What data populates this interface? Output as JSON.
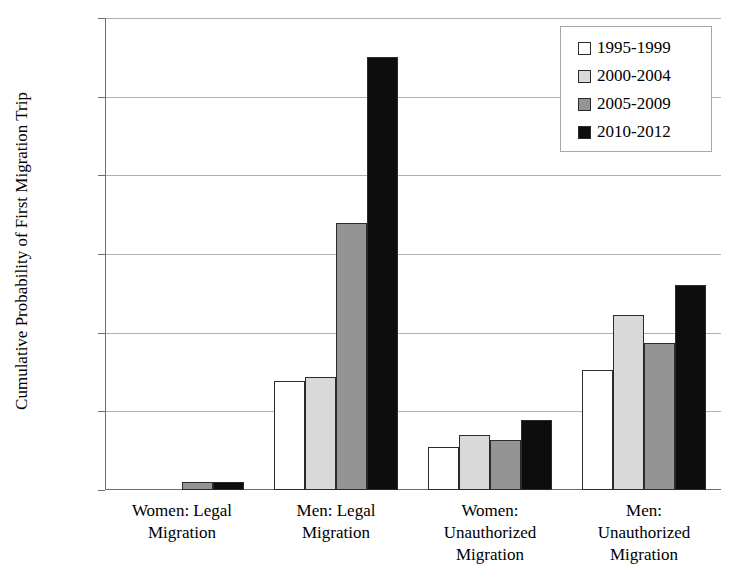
{
  "chart_data": {
    "type": "bar",
    "title": "",
    "xlabel": "",
    "ylabel": "Cumulative Probability of First Migration Trip",
    "ylim": [
      0,
      12
    ],
    "ytick_labels": [
      "0.0%",
      "2.0%",
      "4.0%",
      "6.0%",
      "8.0%",
      "10.0%",
      "12.0%"
    ],
    "ytick_values": [
      0,
      2,
      4,
      6,
      8,
      10,
      12
    ],
    "grid": true,
    "legend_position": "top-right",
    "categories": [
      "Women: Legal Migration",
      "Men: Legal Migration",
      "Women: Unauthorized Migration",
      "Men: Unauthorized Migration"
    ],
    "category_lines": [
      [
        "Women: Legal",
        "Migration"
      ],
      [
        "Men: Legal",
        "Migration"
      ],
      [
        "Women:",
        "Unauthorized",
        "Migration"
      ],
      [
        "Men:",
        "Unauthorized",
        "Migration"
      ]
    ],
    "series": [
      {
        "name": "1995-1999",
        "color": "#ffffff",
        "values": [
          0.0,
          2.78,
          1.1,
          3.05
        ]
      },
      {
        "name": "2000-2004",
        "color": "#d9d9d9",
        "values": [
          0.0,
          2.88,
          1.4,
          4.45
        ]
      },
      {
        "name": "2005-2009",
        "color": "#949494",
        "values": [
          0.2,
          6.78,
          1.28,
          3.75
        ]
      },
      {
        "name": "2010-2012",
        "color": "#0d0d0d",
        "values": [
          0.2,
          11.0,
          1.78,
          5.2
        ]
      }
    ]
  }
}
